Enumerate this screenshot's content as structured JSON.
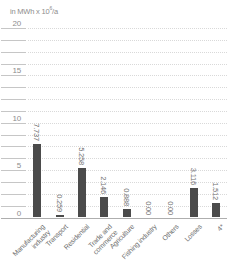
{
  "chart_data": {
    "type": "bar",
    "title": "",
    "unit_label": "in MWh x 10⁶/a",
    "unit_prefix": "in MWh x 10",
    "unit_exponent": "6",
    "unit_suffix": "/a",
    "categories": [
      "Manufacturing industry",
      "Transport",
      "Residential",
      "Trade and commerce",
      "Agriculture",
      "Fishing industry",
      "Others",
      "Losses",
      "4*"
    ],
    "category_lines": [
      [
        "Manufacturing",
        "industry"
      ],
      [
        "Transport"
      ],
      [
        "Residential"
      ],
      [
        "Trade and",
        "commerce"
      ],
      [
        "Agriculture"
      ],
      [
        "Fishing industry"
      ],
      [
        "Others"
      ],
      [
        "Losses"
      ],
      [
        "4*"
      ]
    ],
    "values": [
      7.737,
      0.259,
      5.258,
      2.146,
      0.888,
      0.0,
      0.0,
      3.116,
      1.512
    ],
    "value_labels": [
      "7.737",
      "0.259",
      "5.258",
      "2.146",
      "0.888",
      "0.00",
      "0.00",
      "3.116",
      "1.512"
    ],
    "ylim": [
      0,
      20
    ],
    "yticks": [
      0,
      5,
      10,
      15,
      20
    ],
    "ytick_step": 5,
    "minor_step": 1.25,
    "grid": "dotted horizontal, minor lines every 1.25, tick dashes in left gutter",
    "legend": "none",
    "colors": {
      "bar": "#4b4b4b",
      "value_label": "#6f6f6f",
      "category_label": "#6f6f6f",
      "tick_label": "#8d8d8d",
      "unit_label": "#8d8d8d",
      "gridline": "#d9d9d9",
      "gutter_tick": "#c6c6c6",
      "baseline": "#aeaeae",
      "background": "#ffffff"
    }
  }
}
